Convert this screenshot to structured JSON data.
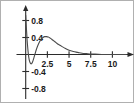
{
  "chart_data": {
    "type": "line",
    "title": "",
    "subtitle": "",
    "xlabel": "",
    "ylabel": "",
    "xlim": [
      -0.6,
      11.8
    ],
    "ylim": [
      -1.0,
      1.0
    ],
    "grid": false,
    "legend": null,
    "axis_style": {
      "x_axis_arrow": true,
      "y_axis_arrow": true,
      "axes_cross_at": [
        0,
        0
      ],
      "line_color": "#2b2b2b",
      "curve_color": "#4a4a4a",
      "background": "#ffffff",
      "border_color": "#b0b0b0"
    },
    "xticks": [
      2.5,
      5,
      7.5,
      10
    ],
    "xtick_labels": [
      "2.5",
      "5",
      "7.5",
      "10"
    ],
    "yticks": [
      0.8,
      0.4,
      -0.4,
      -0.8
    ],
    "ytick_labels": [
      "0.8",
      "0.4",
      "-0.4",
      "-0.8"
    ],
    "series": [
      {
        "name": "curve",
        "x": [
          0.0,
          0.1,
          0.2,
          0.3,
          0.4,
          0.5,
          0.6,
          0.7,
          0.8,
          0.9,
          1.0,
          1.1,
          1.2,
          1.4,
          1.6,
          1.8,
          2.0,
          2.2,
          2.4,
          2.6,
          2.8,
          3.0,
          3.25,
          3.5,
          3.75,
          4.0,
          4.5,
          5.0,
          5.5,
          6.0,
          6.5,
          7.0,
          7.5,
          8.0,
          9.0,
          10.0,
          11.0,
          11.6
        ],
        "y": [
          0.92,
          0.55,
          0.24,
          0.02,
          -0.12,
          -0.19,
          -0.22,
          -0.21,
          -0.17,
          -0.11,
          -0.04,
          0.03,
          0.1,
          0.21,
          0.3,
          0.36,
          0.4,
          0.42,
          0.42,
          0.41,
          0.39,
          0.36,
          0.32,
          0.28,
          0.24,
          0.21,
          0.15,
          0.1,
          0.07,
          0.05,
          0.03,
          0.02,
          0.01,
          0.01,
          0.0,
          0.0,
          0.0,
          0.0
        ]
      }
    ]
  }
}
